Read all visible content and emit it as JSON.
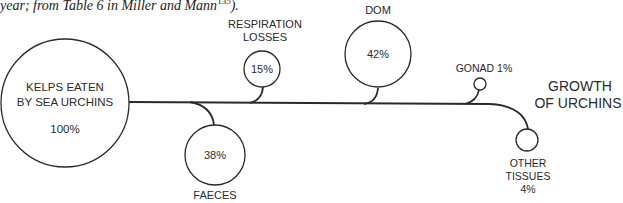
{
  "caption": {
    "text": "year; from Table 6 in Miller and Mann",
    "ref": "135",
    "tail": ")."
  },
  "diagram": {
    "source": {
      "line1": "KELPS EATEN",
      "line2": "BY SEA URCHINS",
      "value": "100%"
    },
    "respiration": {
      "line1": "RESPIRATION",
      "line2": "LOSSES",
      "value": "15%"
    },
    "faeces": {
      "label": "FAECES",
      "value": "38%"
    },
    "dom": {
      "label": "DOM",
      "value": "42%"
    },
    "gonad": {
      "label": "GONAD 1%"
    },
    "growth": {
      "line1": "GROWTH",
      "line2": "OF URCHINS"
    },
    "other_tissues": {
      "line1": "OTHER",
      "line2": "TISSUES",
      "value": "4%"
    }
  },
  "colors": {
    "line": "#2a2a2a",
    "background": "#ffffff"
  }
}
